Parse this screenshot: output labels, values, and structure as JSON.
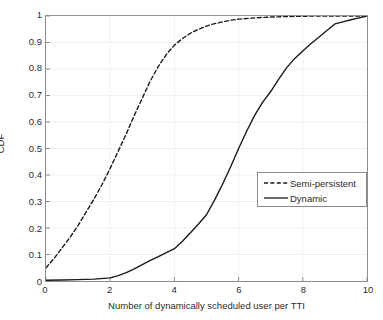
{
  "chart_data": {
    "type": "line",
    "title": "",
    "xlabel": "Number of dynamically scheduled user per TTI",
    "ylabel": "CDF",
    "xlim": [
      0,
      10
    ],
    "ylim": [
      0,
      1
    ],
    "grid": true,
    "legend_position": "center-right",
    "xticks": [
      "0",
      "2",
      "4",
      "6",
      "8",
      "10"
    ],
    "xtick_values": [
      0,
      2,
      4,
      6,
      8,
      10
    ],
    "yticks": [
      "0",
      "0.1",
      "0.2",
      "0.3",
      "0.4",
      "0.5",
      "0.6",
      "0.7",
      "0.8",
      "0.9",
      "1"
    ],
    "ytick_values": [
      0,
      0.1,
      0.2,
      0.3,
      0.4,
      0.5,
      0.6,
      0.7,
      0.8,
      0.9,
      1.0
    ],
    "series": [
      {
        "name": "Semi-persistent",
        "style": "dashed",
        "color": "#1a1a1a",
        "x": [
          0,
          0.25,
          0.5,
          0.75,
          1.0,
          1.25,
          1.5,
          1.75,
          2.0,
          2.25,
          2.5,
          2.75,
          3.0,
          3.25,
          3.5,
          3.75,
          4.0,
          4.25,
          4.5,
          4.75,
          5.0,
          5.25,
          5.5,
          5.75,
          6.0,
          6.5,
          7.0,
          7.5,
          8.0,
          8.5,
          9.0,
          9.5,
          10.0
        ],
        "values": [
          0.05,
          0.085,
          0.125,
          0.165,
          0.21,
          0.26,
          0.31,
          0.365,
          0.425,
          0.49,
          0.555,
          0.625,
          0.69,
          0.755,
          0.81,
          0.855,
          0.89,
          0.915,
          0.935,
          0.95,
          0.962,
          0.971,
          0.978,
          0.984,
          0.988,
          0.993,
          0.996,
          0.998,
          0.999,
          1.0,
          1.0,
          1.0,
          1.0
        ]
      },
      {
        "name": "Dynamic",
        "style": "solid",
        "color": "#1a1a1a",
        "x": [
          0,
          0.5,
          1.0,
          1.5,
          2.0,
          2.25,
          2.5,
          2.75,
          3.0,
          3.25,
          3.5,
          3.75,
          4.0,
          4.25,
          4.5,
          4.75,
          5.0,
          5.25,
          5.5,
          5.75,
          6.0,
          6.25,
          6.5,
          6.75,
          7.0,
          7.25,
          7.5,
          7.75,
          8.0,
          8.25,
          8.5,
          8.75,
          9.0,
          9.25,
          9.5,
          9.75,
          10.0
        ],
        "values": [
          0.003,
          0.004,
          0.005,
          0.007,
          0.012,
          0.02,
          0.032,
          0.046,
          0.062,
          0.078,
          0.092,
          0.107,
          0.122,
          0.15,
          0.182,
          0.215,
          0.25,
          0.305,
          0.365,
          0.43,
          0.5,
          0.565,
          0.625,
          0.675,
          0.715,
          0.762,
          0.805,
          0.84,
          0.868,
          0.895,
          0.92,
          0.945,
          0.97,
          0.978,
          0.986,
          0.993,
          1.0
        ]
      }
    ],
    "colors": {
      "axis": "#8c8c8c",
      "grid": "#f0f0f0",
      "text": "#2b2b2b",
      "background": "#ffffff",
      "curve": "#1a1a1a"
    }
  }
}
